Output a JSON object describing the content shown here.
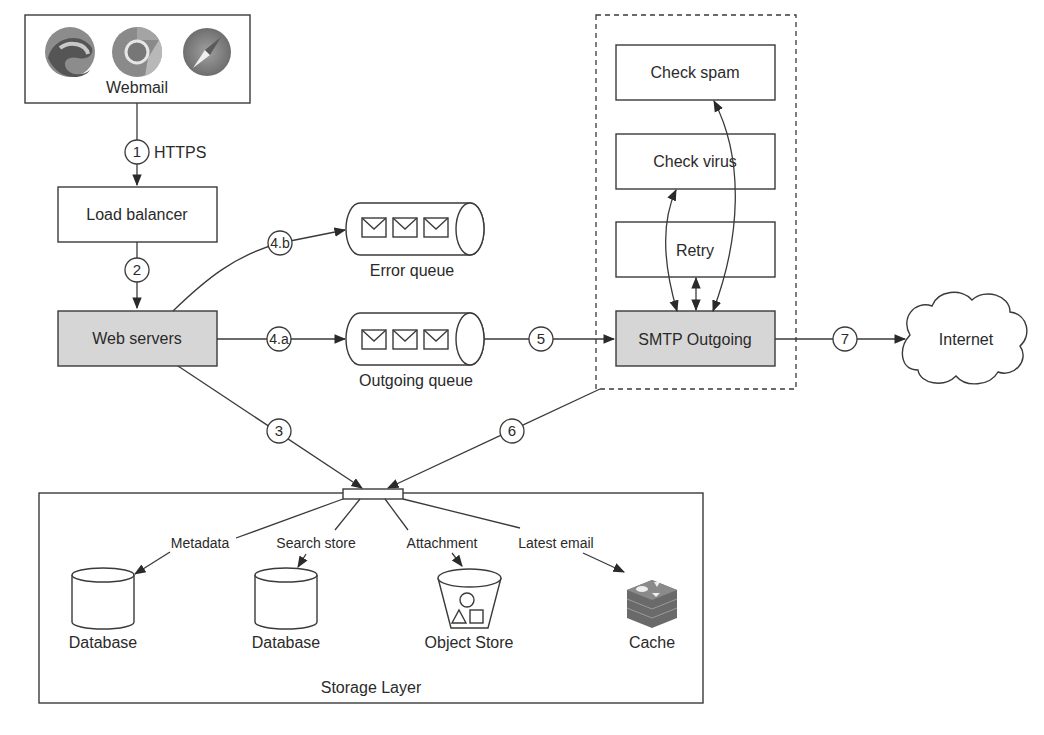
{
  "diagram": {
    "webmail": {
      "label": "Webmail",
      "icons": [
        "edge-browser-icon",
        "chrome-browser-icon",
        "safari-browser-icon"
      ]
    },
    "load_balancer": {
      "label": "Load balancer"
    },
    "web_servers": {
      "label": "Web servers"
    },
    "error_queue": {
      "label": "Error queue"
    },
    "outgoing_queue": {
      "label": "Outgoing queue"
    },
    "smtp_group": {
      "check_spam": "Check spam",
      "check_virus": "Check virus",
      "retry": "Retry",
      "smtp_outgoing": "SMTP Outgoing"
    },
    "internet": {
      "label": "Internet"
    },
    "storage": {
      "title": "Storage Layer",
      "edges": {
        "metadata": "Metadata",
        "search_store": "Search store",
        "attachment": "Attachment",
        "latest_email": "Latest email"
      },
      "nodes": {
        "database1": "Database",
        "database2": "Database",
        "object_store": "Object Store",
        "cache": "Cache"
      }
    },
    "steps": {
      "s1": "1",
      "s1_label": "HTTPS",
      "s2": "2",
      "s3": "3",
      "s4a": "4.a",
      "s4b": "4.b",
      "s5": "5",
      "s6": "6",
      "s7": "7"
    },
    "colors": {
      "stroke": "#3a3a3a",
      "highlight_fill": "#d6d6d6",
      "background": "#ffffff"
    }
  }
}
